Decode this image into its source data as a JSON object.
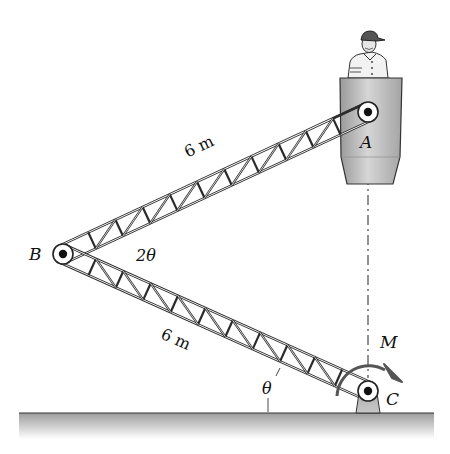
{
  "figure": {
    "points": {
      "A": {
        "label": "A",
        "x": 368,
        "y": 112
      },
      "B": {
        "label": "B",
        "x": 63,
        "y": 254
      },
      "C": {
        "label": "C",
        "x": 368,
        "y": 391
      }
    },
    "labels": {
      "upper_length": "6 m",
      "lower_length": "6 m",
      "angle_B": "2θ",
      "angle_C": "θ",
      "moment": "M",
      "point_A": "A",
      "point_B": "B",
      "point_C": "C"
    },
    "colors": {
      "truss": "#2a2a2a",
      "bucket": "#b9b9b9",
      "ground": "#a8a8a8",
      "pin_fill": "#ffffff",
      "pin_dot": "#111111"
    }
  }
}
